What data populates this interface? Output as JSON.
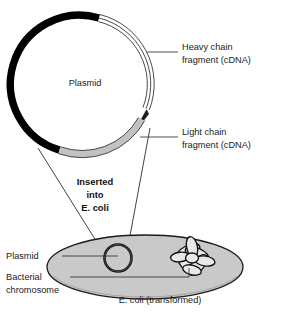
{
  "diagram": {
    "title_center_label": "Plasmid",
    "transfer_note_lines": [
      "Inserted",
      "into",
      "E. coli"
    ],
    "cell_caption": "E. coli (transformed)",
    "labels": {
      "heavy_chain_line1": "Heavy chain",
      "heavy_chain_line2": "fragment (cDNA)",
      "light_chain_line1": "Light chain",
      "light_chain_line2": "fragment (cDNA)",
      "cell_plasmid": "Plasmid",
      "bacterial_chromosome_line1": "Bacterial",
      "bacterial_chromosome_line2": "chromosome"
    },
    "colors": {
      "plasmid_backbone": "#000000",
      "heavy_chain_fragment": "#ffffff",
      "light_chain_fragment": "#c2c2c2",
      "cell_fill": "#c9c9c9",
      "outline": "#1a1a1a",
      "background": "#ffffff"
    }
  }
}
